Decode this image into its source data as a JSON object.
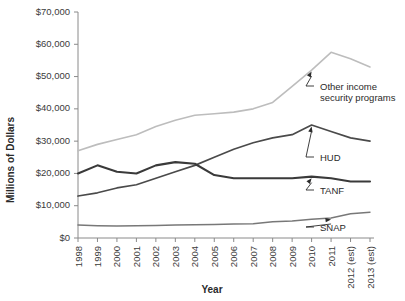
{
  "chart_data": {
    "type": "line",
    "title": "",
    "xlabel": "Year",
    "ylabel": "Millions of Dollars",
    "grid": false,
    "legend_position": "inline-annotations",
    "ylim": [
      0,
      70000
    ],
    "ytick_values": [
      0,
      10000,
      20000,
      30000,
      40000,
      50000,
      60000,
      70000
    ],
    "ytick_labels": [
      "$0",
      "$10,000",
      "$20,000",
      "$30,000",
      "$40,000",
      "$50,000",
      "$60,000",
      "$70,000"
    ],
    "categories": [
      "1998",
      "1999",
      "2000",
      "2001",
      "2002",
      "2003",
      "2004",
      "2005",
      "2006",
      "2007",
      "2008",
      "2009",
      "2010",
      "2011",
      "2012 (est)",
      "2013 (est)"
    ],
    "series": [
      {
        "name": "Other income security programs",
        "color": "#bdbdbd",
        "width": 1.6,
        "values": [
          27000,
          29000,
          30500,
          32000,
          34500,
          36500,
          38000,
          38500,
          39000,
          40000,
          42000,
          47000,
          52000,
          57500,
          55500,
          53000
        ]
      },
      {
        "name": "HUD",
        "color": "#4a4a4a",
        "width": 1.7,
        "values": [
          13000,
          14000,
          15500,
          16500,
          18500,
          20500,
          22500,
          25000,
          27500,
          29500,
          31000,
          32000,
          35000,
          33000,
          31000,
          30000
        ]
      },
      {
        "name": "TANF",
        "color": "#3a3a3a",
        "width": 2.1,
        "values": [
          20000,
          22500,
          20500,
          20000,
          22500,
          23500,
          23000,
          19500,
          18500,
          18500,
          18500,
          18500,
          19000,
          18500,
          17500,
          17500
        ]
      },
      {
        "name": "SNAP",
        "color": "#787878",
        "width": 1.5,
        "values": [
          4000,
          3800,
          3700,
          3800,
          3900,
          4000,
          4100,
          4200,
          4300,
          4400,
          5000,
          5300,
          5800,
          6200,
          7500,
          8000
        ]
      }
    ],
    "annotations": [
      {
        "label_line1": "Other income",
        "label_line2": "security programs",
        "target_series": "Other income security programs",
        "target_index": 12
      },
      {
        "label_line1": "HUD",
        "label_line2": "",
        "target_series": "HUD",
        "target_index": 12
      },
      {
        "label_line1": "TANF",
        "label_line2": "",
        "target_series": "TANF",
        "target_index": 12
      },
      {
        "label_line1": "SNAP",
        "label_line2": "",
        "target_series": "SNAP",
        "target_index": 13
      }
    ]
  }
}
